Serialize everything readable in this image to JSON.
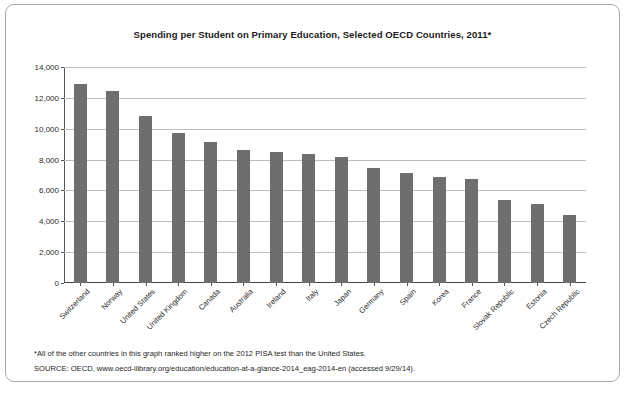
{
  "chart_data": {
    "type": "bar",
    "title": "Spending per Student on Primary Education, Selected OECD Countries, 2011*",
    "xlabel": "",
    "ylabel": "",
    "ylim": [
      0,
      14000
    ],
    "yticks": [
      "0",
      "2,000",
      "4,000",
      "6,000",
      "8,000",
      "10,000",
      "12,000",
      "14,000"
    ],
    "ytick_values": [
      0,
      2000,
      4000,
      6000,
      8000,
      10000,
      12000,
      14000
    ],
    "grid": true,
    "legend": "none",
    "bar_color": "#6e6e6e",
    "categories": [
      "Switzerland",
      "Norway",
      "United States",
      "United Kingdom",
      "Canada",
      "Australia",
      "Ireland",
      "Italy",
      "Japan",
      "Germany",
      "Spain",
      "Korea",
      "France",
      "Slovak Republic",
      "Estonia",
      "Czech Republic"
    ],
    "values": [
      12900,
      12450,
      10850,
      9750,
      9150,
      8650,
      8500,
      8350,
      8200,
      7450,
      7150,
      6850,
      6750,
      5350,
      5100,
      4400
    ]
  },
  "notes": {
    "footnote": "*All of the other countries in this graph ranked higher on the 2012 PISA test than the United States.",
    "source": "SOURCE:  OECD, www.oecd-ilibrary.org/education/education-at-a-glance-2014_eag-2014-en (accessed 9/29/14)."
  }
}
